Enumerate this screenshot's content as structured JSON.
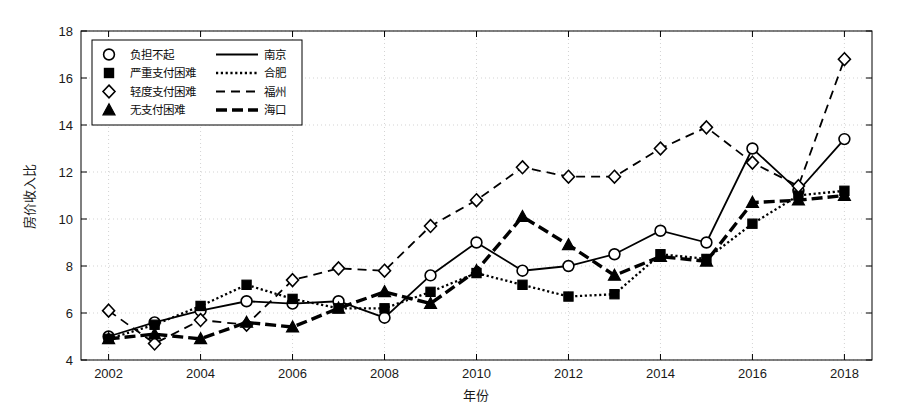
{
  "chart_data": {
    "type": "line",
    "title": "",
    "xlabel": "年份",
    "ylabel": "房价收入比",
    "xlim": [
      2001.4,
      2018.6
    ],
    "ylim": [
      4,
      18
    ],
    "yticks": [
      4,
      6,
      8,
      10,
      12,
      14,
      16,
      18
    ],
    "xticks": [
      2002,
      2004,
      2006,
      2008,
      2010,
      2012,
      2014,
      2016,
      2018
    ],
    "grid": true,
    "legend_position": "upper-left",
    "x": [
      2002,
      2003,
      2004,
      2005,
      2006,
      2007,
      2008,
      2009,
      2010,
      2011,
      2012,
      2013,
      2014,
      2015,
      2016,
      2017,
      2018
    ],
    "series": [
      {
        "name": "南京",
        "marker": "circle-open",
        "line": "solid",
        "values": [
          5.0,
          5.6,
          6.1,
          6.5,
          6.4,
          6.5,
          5.8,
          7.6,
          9.0,
          7.8,
          8.0,
          8.5,
          9.5,
          9.0,
          13.0,
          11.2,
          13.4
        ]
      },
      {
        "name": "合肥",
        "marker": "square-filled",
        "line": "dotted",
        "values": [
          4.9,
          5.5,
          6.3,
          7.2,
          6.6,
          6.2,
          6.2,
          6.9,
          7.7,
          7.2,
          6.7,
          6.8,
          8.5,
          8.3,
          9.8,
          11.0,
          11.2
        ]
      },
      {
        "name": "福州",
        "marker": "diamond-open",
        "line": "dashed",
        "values": [
          6.1,
          4.7,
          5.7,
          5.5,
          7.4,
          7.9,
          7.8,
          9.7,
          10.8,
          12.2,
          11.8,
          11.8,
          13.0,
          13.9,
          12.4,
          11.4,
          16.8
        ]
      },
      {
        "name": "海口",
        "marker": "triangle-filled",
        "line": "thick-dashed",
        "values": [
          4.9,
          5.1,
          4.9,
          5.6,
          5.4,
          6.2,
          6.9,
          6.4,
          7.8,
          10.1,
          8.9,
          7.6,
          8.4,
          8.2,
          10.7,
          10.8,
          11.0
        ]
      }
    ],
    "legend": [
      {
        "marker": "circle-open",
        "category": "负担不起",
        "line": "solid",
        "city": "南京"
      },
      {
        "marker": "square-filled",
        "category": "严重支付困难",
        "line": "dotted",
        "city": "合肥"
      },
      {
        "marker": "diamond-open",
        "category": "轻度支付困难",
        "line": "dashed",
        "city": "福州"
      },
      {
        "marker": "triangle-filled",
        "category": "无支付困难",
        "line": "thick-dashed",
        "city": "海口"
      }
    ],
    "colors": {
      "line": "#000000",
      "grid": "#c8c8c8",
      "axis": "#000000",
      "background": "#ffffff"
    }
  }
}
